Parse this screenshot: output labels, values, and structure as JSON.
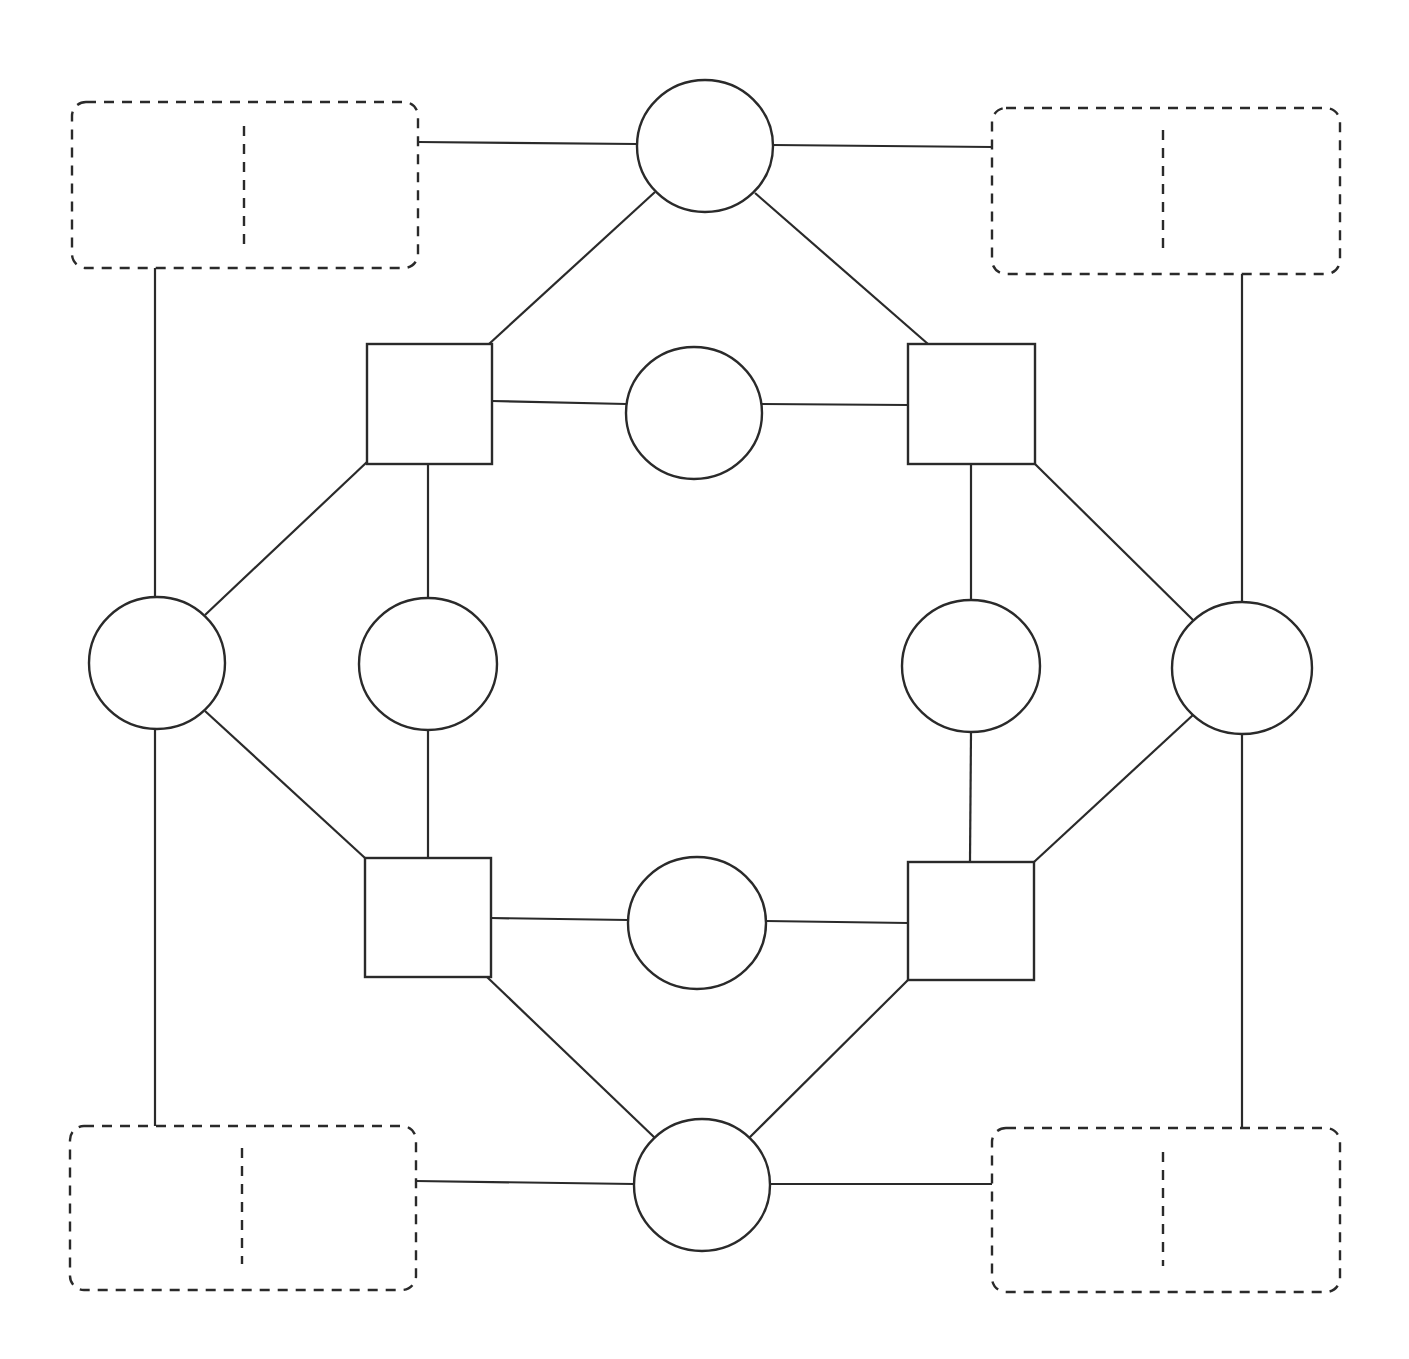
{
  "diagram": {
    "title": "",
    "stroke_color": "#2a2a2a",
    "background": "#ffffff",
    "dashed_boxes": [
      {
        "id": "box-top-left",
        "x": 72,
        "y": 102,
        "w": 346,
        "h": 166,
        "divider_x": 244,
        "divider_y1": 126,
        "divider_y2": 244
      },
      {
        "id": "box-top-right",
        "x": 992,
        "y": 108,
        "w": 348,
        "h": 166,
        "divider_x": 1163,
        "divider_y1": 130,
        "divider_y2": 248
      },
      {
        "id": "box-bottom-left",
        "x": 70,
        "y": 1126,
        "w": 346,
        "h": 164,
        "divider_x": 242,
        "divider_y1": 1148,
        "divider_y2": 1264
      },
      {
        "id": "box-bottom-right",
        "x": 992,
        "y": 1128,
        "w": 348,
        "h": 164,
        "divider_x": 1163,
        "divider_y1": 1152,
        "divider_y2": 1266
      }
    ],
    "outer_circles": [
      {
        "id": "circle-top",
        "cx": 705,
        "cy": 146,
        "rx": 68,
        "ry": 66
      },
      {
        "id": "circle-left",
        "cx": 157,
        "cy": 663,
        "rx": 68,
        "ry": 66
      },
      {
        "id": "circle-right",
        "cx": 1242,
        "cy": 668,
        "rx": 70,
        "ry": 66
      },
      {
        "id": "circle-bottom",
        "cx": 702,
        "cy": 1185,
        "rx": 68,
        "ry": 66
      }
    ],
    "inner_circles": [
      {
        "id": "inner-circle-top",
        "cx": 694,
        "cy": 413,
        "rx": 68,
        "ry": 66
      },
      {
        "id": "inner-circle-left",
        "cx": 428,
        "cy": 664,
        "rx": 69,
        "ry": 66
      },
      {
        "id": "inner-circle-right",
        "cx": 971,
        "cy": 666,
        "rx": 69,
        "ry": 66
      },
      {
        "id": "inner-circle-bottom",
        "cx": 697,
        "cy": 923,
        "rx": 69,
        "ry": 66
      }
    ],
    "squares": [
      {
        "id": "square-top-left",
        "x": 367,
        "y": 344,
        "w": 125,
        "h": 120
      },
      {
        "id": "square-top-right",
        "x": 908,
        "y": 344,
        "w": 127,
        "h": 120
      },
      {
        "id": "square-bottom-left",
        "x": 365,
        "y": 858,
        "w": 126,
        "h": 119
      },
      {
        "id": "square-bottom-right",
        "x": 908,
        "y": 862,
        "w": 126,
        "h": 118
      }
    ],
    "edges": [
      {
        "x1": 418,
        "y1": 142,
        "x2": 637,
        "y2": 144
      },
      {
        "x1": 773,
        "y1": 145,
        "x2": 992,
        "y2": 147
      },
      {
        "x1": 655,
        "y1": 192,
        "x2": 489,
        "y2": 344
      },
      {
        "x1": 755,
        "y1": 193,
        "x2": 928,
        "y2": 344
      },
      {
        "x1": 492,
        "y1": 401,
        "x2": 626,
        "y2": 404
      },
      {
        "x1": 762,
        "y1": 404,
        "x2": 908,
        "y2": 405
      },
      {
        "x1": 155,
        "y1": 268,
        "x2": 155,
        "y2": 597
      },
      {
        "x1": 1242,
        "y1": 274,
        "x2": 1242,
        "y2": 602
      },
      {
        "x1": 367,
        "y1": 462,
        "x2": 205,
        "y2": 615
      },
      {
        "x1": 1035,
        "y1": 464,
        "x2": 1193,
        "y2": 620
      },
      {
        "x1": 428,
        "y1": 464,
        "x2": 428,
        "y2": 598
      },
      {
        "x1": 971,
        "y1": 464,
        "x2": 971,
        "y2": 600
      },
      {
        "x1": 428,
        "y1": 730,
        "x2": 428,
        "y2": 858
      },
      {
        "x1": 971,
        "y1": 732,
        "x2": 970,
        "y2": 862
      },
      {
        "x1": 205,
        "y1": 711,
        "x2": 365,
        "y2": 858
      },
      {
        "x1": 1193,
        "y1": 715,
        "x2": 1034,
        "y2": 862
      },
      {
        "x1": 155,
        "y1": 729,
        "x2": 155,
        "y2": 1126
      },
      {
        "x1": 1242,
        "y1": 734,
        "x2": 1242,
        "y2": 1128
      },
      {
        "x1": 491,
        "y1": 918,
        "x2": 628,
        "y2": 920
      },
      {
        "x1": 766,
        "y1": 921,
        "x2": 908,
        "y2": 923
      },
      {
        "x1": 487,
        "y1": 977,
        "x2": 655,
        "y2": 1138
      },
      {
        "x1": 908,
        "y1": 980,
        "x2": 749,
        "y2": 1138
      },
      {
        "x1": 416,
        "y1": 1181,
        "x2": 634,
        "y2": 1184
      },
      {
        "x1": 770,
        "y1": 1184,
        "x2": 992,
        "y2": 1184
      }
    ]
  }
}
